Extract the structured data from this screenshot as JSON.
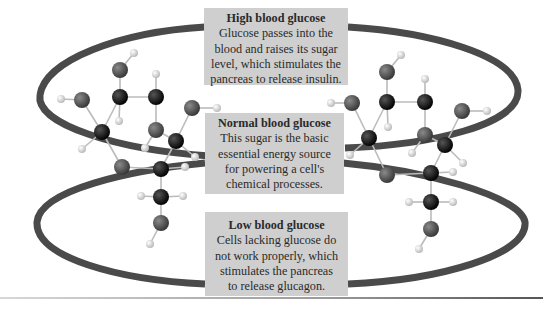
{
  "diagram": {
    "type": "glucose-level-cycle",
    "boxes": [
      {
        "id": "high",
        "title": "High blood glucose",
        "body": "Glucose passes into the\nblood and raises its sugar\nlevel, which stimulates the\npancreas to release insulin."
      },
      {
        "id": "normal",
        "title": "Normal blood glucose",
        "body": "This sugar is the basic\nessential energy source\nfor powering a cell's\nchemical processes."
      },
      {
        "id": "low",
        "title": "Low blood glucose",
        "body": "Cells lacking glucose do\nnot work properly, which\nstimulates the pancreas\nto release glucagon."
      }
    ],
    "molecules": [
      {
        "name": "glucose-molecule-left",
        "position": "left"
      },
      {
        "name": "glucose-molecule-right",
        "position": "right"
      }
    ],
    "colors": {
      "box_bg": "#cfcfcf",
      "loop": "#4a4a4a",
      "carbon": "#111111",
      "oxygen": "#5a5a5a",
      "hydrogen": "#f2f2f2"
    }
  }
}
